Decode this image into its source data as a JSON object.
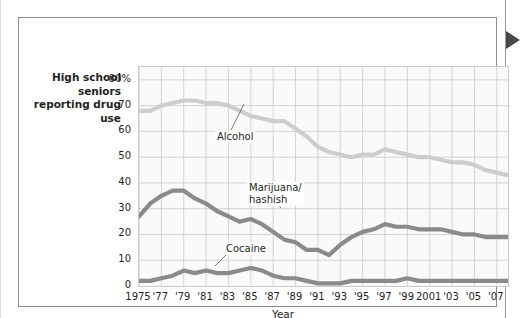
{
  "figure": {
    "y_axis_caption": "High school seniors reporting drug use",
    "pointer_icon": "right-triangle-marker"
  },
  "chart_data": {
    "type": "line",
    "title": "",
    "xlabel": "Year",
    "ylabel": "High school seniors reporting drug use",
    "xlim": [
      1975,
      2008
    ],
    "ylim": [
      0,
      85
    ],
    "grid": true,
    "legend": "inline-labels",
    "ytick_labels": [
      "80%",
      "70",
      "60",
      "50",
      "40",
      "30",
      "20",
      "10",
      "0"
    ],
    "ytick_values": [
      80,
      70,
      60,
      50,
      40,
      30,
      20,
      10,
      0
    ],
    "xtick_labels": [
      "1975",
      "'77",
      "'79",
      "'81",
      "'83",
      "'85",
      "'87",
      "'89",
      "'91",
      "'93",
      "'95",
      "'97",
      "'99",
      "2001",
      "'03",
      "'05",
      "'07"
    ],
    "xtick_values": [
      1975,
      1977,
      1979,
      1981,
      1983,
      1985,
      1987,
      1989,
      1991,
      1993,
      1995,
      1997,
      1999,
      2001,
      2003,
      2005,
      2007
    ],
    "x": [
      1975,
      1976,
      1977,
      1978,
      1979,
      1980,
      1981,
      1982,
      1983,
      1984,
      1985,
      1986,
      1987,
      1988,
      1989,
      1990,
      1991,
      1992,
      1993,
      1994,
      1995,
      1996,
      1997,
      1998,
      1999,
      2000,
      2001,
      2002,
      2003,
      2004,
      2005,
      2006,
      2007,
      2008
    ],
    "series": [
      {
        "name": "Alcohol",
        "color": "#cdcdcd",
        "values": [
          68,
          68,
          70,
          71,
          72,
          72,
          71,
          71,
          70,
          68,
          66,
          65,
          64,
          64,
          61,
          58,
          54,
          52,
          51,
          50,
          51,
          51,
          53,
          52,
          51,
          50,
          50,
          49,
          48,
          48,
          47,
          45,
          44,
          43
        ]
      },
      {
        "name": "Marijuana/hashish",
        "color": "#8a8a8a",
        "values": [
          27,
          32,
          35,
          37,
          37,
          34,
          32,
          29,
          27,
          25,
          26,
          24,
          21,
          18,
          17,
          14,
          14,
          12,
          16,
          19,
          21,
          22,
          24,
          23,
          23,
          22,
          22,
          22,
          21,
          20,
          20,
          19,
          19,
          19
        ]
      },
      {
        "name": "Cocaine",
        "color": "#8a8a8a",
        "values": [
          2,
          2,
          3,
          4,
          6,
          5,
          6,
          5,
          5,
          6,
          7,
          6,
          4,
          3,
          3,
          2,
          1,
          1,
          1,
          2,
          2,
          2,
          2,
          2,
          3,
          2,
          2,
          2,
          2,
          2,
          2,
          2,
          2,
          2
        ]
      }
    ],
    "annotations": [
      {
        "name": "Alcohol",
        "label": "Alcohol"
      },
      {
        "name": "Marijuana",
        "label": "Marijuana/"
      },
      {
        "name": "Marijuana2",
        "label": "hashish"
      },
      {
        "name": "Cocaine",
        "label": "Cocaine"
      }
    ]
  }
}
